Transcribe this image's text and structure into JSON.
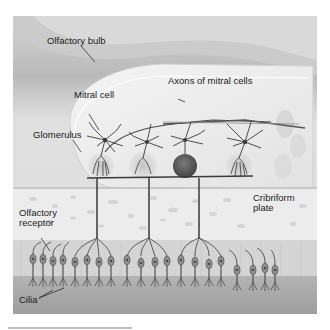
{
  "figure": {
    "labels": {
      "olfactory_bulb": "Olfactory bulb",
      "mitral_cell": "Mitral cell",
      "axons_of_mitral_cells": "Axons of mitral cells",
      "glomerulus": "Glomerulus",
      "olfactory_receptor_line1": "Olfactory",
      "olfactory_receptor_line2": "receptor",
      "cribriform_plate_line1": "Cribriform",
      "cribriform_plate_line2": "plate",
      "cilia": "Cilia"
    },
    "colors": {
      "background_tissue": "#cfcfcf",
      "bulb_fill": "#ececec",
      "bone": "#eeeeee",
      "epithelium": "#bdbdbd",
      "mucus": "#a9a9a9",
      "neuron": "#3a3a3a",
      "glomerulus_dark": "#5a5a5a",
      "glomerulus_light": "#b8b8b8"
    }
  }
}
